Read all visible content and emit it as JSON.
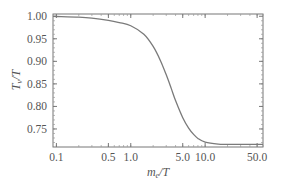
{
  "chart_data": {
    "type": "line",
    "title": "",
    "xlabel": "m_e/T",
    "ylabel": "T_ν/T",
    "xscale": "log",
    "xlim": [
      0.09,
      60
    ],
    "ylim": [
      0.71,
      1.005
    ],
    "grid": false,
    "legend": null,
    "x_ticks": [
      0.1,
      0.5,
      1.0,
      5.0,
      10.0,
      50.0
    ],
    "x_tick_labels": [
      "0.1",
      "0.5",
      "1.0",
      "5.0",
      "10.0",
      "50.0"
    ],
    "y_ticks": [
      1.0,
      0.95,
      0.9,
      0.85,
      0.8,
      0.75
    ],
    "y_tick_labels": [
      "1.00",
      "0.95",
      "0.90",
      "0.85",
      "0.80",
      "0.75"
    ],
    "series": [
      {
        "name": "T_nu/T",
        "color": "#7a7a7a",
        "x": [
          0.09,
          0.1,
          0.2,
          0.3,
          0.5,
          0.7,
          1.0,
          1.5,
          2.0,
          2.5,
          3.0,
          3.5,
          4.0,
          5.0,
          6.0,
          7.0,
          8.0,
          10.0,
          15.0,
          20.0,
          30.0,
          50.0,
          60.0
        ],
        "values": [
          0.9995,
          0.9994,
          0.998,
          0.996,
          0.991,
          0.986,
          0.979,
          0.96,
          0.933,
          0.902,
          0.87,
          0.84,
          0.813,
          0.775,
          0.752,
          0.738,
          0.729,
          0.721,
          0.7165,
          0.716,
          0.7158,
          0.7158,
          0.7158
        ]
      }
    ]
  },
  "labels": {
    "xlabel_main": "m",
    "xlabel_sub": "e",
    "xlabel_tail": "/T",
    "ylabel_main": "T",
    "ylabel_sub": "ν",
    "ylabel_tail": "/T"
  }
}
